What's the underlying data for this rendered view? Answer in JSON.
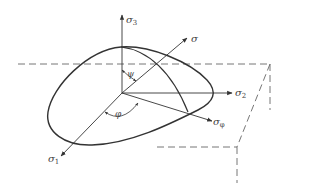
{
  "diagram": {
    "type": "stress-space yield surface",
    "colors": {
      "stroke": "#333333",
      "dashed": "#666666",
      "label": "#444444",
      "background": "#ffffff"
    },
    "axes": {
      "sigma3": {
        "symbol": "σ",
        "sub": "3"
      },
      "sigma": {
        "symbol": "σ",
        "sub": ""
      },
      "sigma2": {
        "symbol": "σ",
        "sub": "2"
      },
      "sigma_phi": {
        "symbol": "σ",
        "sub": "φ"
      },
      "sigma1": {
        "symbol": "σ",
        "sub": "1"
      }
    },
    "angles": {
      "psi": "ψ",
      "phi": "φ"
    }
  }
}
